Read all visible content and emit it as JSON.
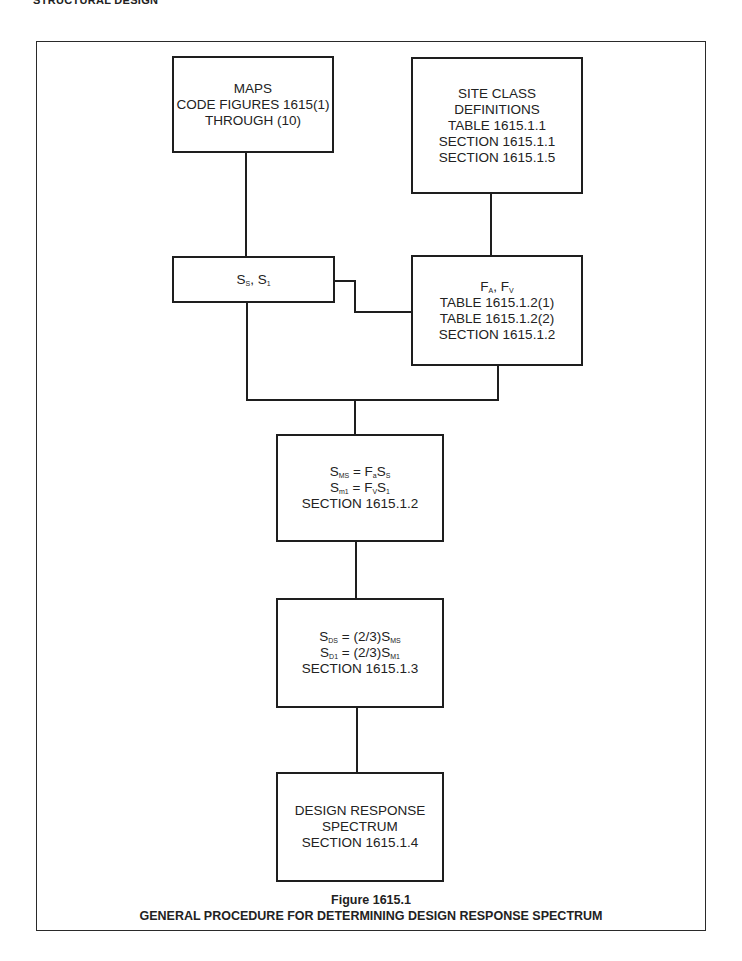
{
  "header": {
    "section_title": "STRUCTURAL DESIGN"
  },
  "boxes": {
    "maps": {
      "lines": [
        "MAPS",
        "CODE FIGURES 1615(1)",
        "THROUGH (10)"
      ]
    },
    "site_class": {
      "lines": [
        "SITE CLASS",
        "DEFINITIONS",
        "TABLE 1615.1.1",
        "SECTION 1615.1.1",
        "SECTION 1615.1.5"
      ]
    },
    "ss_s1": {
      "s1_base": "S",
      "s1_sub": "S",
      "sep": ", ",
      "s2_base": "S",
      "s2_sub": "1"
    },
    "fa_fv": {
      "f1_base": "F",
      "f1_sub": "A",
      "sep": ", ",
      "f2_base": "F",
      "f2_sub": "V",
      "lines": [
        "TABLE 1615.1.2(1)",
        "TABLE 1615.1.2(2)",
        "SECTION 1615.1.2"
      ]
    },
    "sms_sm1": {
      "eq1": {
        "lhs_base": "S",
        "lhs_sub": "MS",
        "op": " = ",
        "r1_base": "F",
        "r1_sub": "a",
        "r2_base": "S",
        "r2_sub": "S"
      },
      "eq2": {
        "lhs_base": "S",
        "lhs_sub": "m1",
        "op": " = ",
        "r1_base": "F",
        "r1_sub": "V",
        "r2_base": "S",
        "r2_sub": "1"
      },
      "section": "SECTION 1615.1.2"
    },
    "sds_sd1": {
      "eq1": {
        "lhs_base": "S",
        "lhs_sub": "DS",
        "op": " = (2/3)",
        "r_base": "S",
        "r_sub": "MS"
      },
      "eq2": {
        "lhs_base": "S",
        "lhs_sub": "D1",
        "op": " = (2/3)",
        "r_base": "S",
        "r_sub": "M1"
      },
      "section": "SECTION 1615.1.3"
    },
    "design_spectrum": {
      "lines": [
        "DESIGN RESPONSE",
        "SPECTRUM",
        "SECTION 1615.1.4"
      ]
    }
  },
  "caption": {
    "figure_number": "Figure 1615.1",
    "title": "GENERAL PROCEDURE FOR DETERMINING DESIGN RESPONSE SPECTRUM"
  }
}
